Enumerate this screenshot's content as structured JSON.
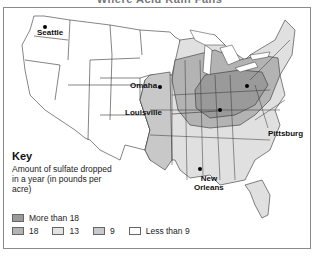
{
  "title": "Where Acid Rain Falls",
  "cities": [
    {
      "name": "Seattle"
    },
    {
      "name": "Omaha"
    },
    {
      "name": "Louisville"
    },
    {
      "name": "Pittsburg"
    },
    {
      "name": "New Orleans",
      "line1": "New",
      "line2": "Orleans"
    }
  ],
  "key": {
    "title": "Key",
    "description": "Amount of sulfate dropped in a year (in pounds per acre)",
    "items": [
      {
        "label": "More than 18",
        "color": "#9a9a9a"
      },
      {
        "label": "18",
        "color": "#b3b3b3"
      },
      {
        "label": "13",
        "color": "#e2e2e2"
      },
      {
        "label": "9",
        "color": "#c8c8c8"
      },
      {
        "label": "Less than 9",
        "color": "#ffffff"
      }
    ]
  },
  "colors": {
    "border": "#8a8a8a",
    "lake": "#ffffff",
    "state_line": "#333333"
  }
}
